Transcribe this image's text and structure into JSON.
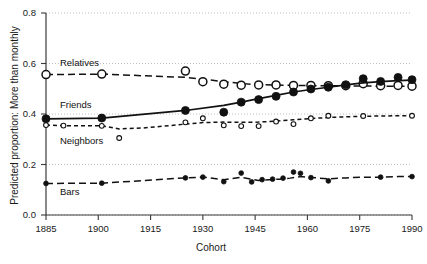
{
  "chart_data": {
    "type": "line",
    "title": "",
    "xlabel": "Cohort",
    "ylabel": "Predicted proportion: More than monthly",
    "xlim": [
      1885,
      1990
    ],
    "ylim": [
      0.0,
      0.8
    ],
    "xticks": [
      1885,
      1900,
      1915,
      1930,
      1945,
      1960,
      1975,
      1990
    ],
    "xticklabels": [
      "1885",
      "1900",
      "1915",
      "1930",
      "1945",
      "1960",
      "1975",
      "1990"
    ],
    "yticks": [
      0.0,
      0.2,
      0.4,
      0.6,
      0.8
    ],
    "yticklabels": [
      "0.0",
      "0.2",
      "0.4",
      "0.6",
      "0.8"
    ],
    "grid": "horizontal-dotted",
    "legend_position": "inline-annotations",
    "series": [
      {
        "name": "Relatives",
        "marker": "open-circle",
        "marker_size": "large",
        "line_style": "dashed",
        "label_x": 1889,
        "label_y": 0.597,
        "fit_x": [
          1885,
          1901,
          1925,
          1930,
          1936,
          1941,
          1945,
          1950,
          1954,
          1958,
          1962,
          1966,
          1971,
          1976,
          1981,
          1985,
          1990
        ],
        "fit_y": [
          0.556,
          0.558,
          0.545,
          0.538,
          0.528,
          0.521,
          0.517,
          0.515,
          0.514,
          0.513,
          0.512,
          0.512,
          0.511,
          0.511,
          0.51,
          0.51,
          0.51
        ],
        "points_x": [
          1885,
          1901,
          1925,
          1930,
          1936,
          1941,
          1946,
          1951,
          1956,
          1961,
          1966,
          1971,
          1976,
          1981,
          1986,
          1990
        ],
        "points_y": [
          0.556,
          0.558,
          0.57,
          0.528,
          0.518,
          0.514,
          0.515,
          0.515,
          0.513,
          0.513,
          0.512,
          0.512,
          0.52,
          0.512,
          0.513,
          0.51
        ]
      },
      {
        "name": "Friends",
        "marker": "filled-circle",
        "marker_size": "large",
        "line_style": "solid",
        "label_x": 1889,
        "label_y": 0.432,
        "fit_x": [
          1885,
          1901,
          1925,
          1936,
          1941,
          1946,
          1951,
          1956,
          1961,
          1966,
          1971,
          1976,
          1981,
          1986,
          1990
        ],
        "fit_y": [
          0.381,
          0.384,
          0.414,
          0.434,
          0.447,
          0.461,
          0.474,
          0.487,
          0.497,
          0.506,
          0.515,
          0.523,
          0.528,
          0.532,
          0.534
        ],
        "points_x": [
          1885,
          1901,
          1925,
          1936,
          1941,
          1946,
          1951,
          1956,
          1961,
          1966,
          1971,
          1976,
          1981,
          1986,
          1990
        ],
        "points_y": [
          0.381,
          0.384,
          0.414,
          0.407,
          0.447,
          0.457,
          0.47,
          0.487,
          0.499,
          0.506,
          0.516,
          0.54,
          0.529,
          0.545,
          0.536
        ]
      },
      {
        "name": "Neighbors",
        "marker": "open-circle",
        "marker_size": "small",
        "line_style": "dotted-dashed",
        "label_x": 1889,
        "label_y": 0.29,
        "fit_x": [
          1885,
          1890,
          1901,
          1906,
          1913,
          1919,
          1925,
          1930,
          1936,
          1941,
          1946,
          1951,
          1956,
          1961,
          1966,
          1971,
          1976,
          1981,
          1986,
          1990
        ],
        "fit_y": [
          0.356,
          0.354,
          0.353,
          0.341,
          0.345,
          0.352,
          0.36,
          0.366,
          0.368,
          0.367,
          0.368,
          0.372,
          0.377,
          0.382,
          0.386,
          0.389,
          0.391,
          0.392,
          0.393,
          0.393
        ],
        "points_x": [
          1885,
          1890,
          1901,
          1906,
          1925,
          1930,
          1936,
          1941,
          1946,
          1951,
          1956,
          1961,
          1966,
          1976,
          1990
        ],
        "points_y": [
          0.356,
          0.354,
          0.353,
          0.305,
          0.367,
          0.383,
          0.355,
          0.352,
          0.352,
          0.37,
          0.36,
          0.383,
          0.393,
          0.392,
          0.393
        ]
      },
      {
        "name": "Bars",
        "marker": "filled-circle",
        "marker_size": "small",
        "line_style": "dashed",
        "label_x": 1889,
        "label_y": 0.086,
        "fit_x": [
          1885,
          1901,
          1925,
          1930,
          1936,
          1941,
          1946,
          1949,
          1952,
          1955,
          1958,
          1961,
          1966,
          1971,
          1976,
          1981,
          1986,
          1990
        ],
        "fit_y": [
          0.125,
          0.126,
          0.147,
          0.15,
          0.14,
          0.149,
          0.137,
          0.14,
          0.142,
          0.146,
          0.152,
          0.149,
          0.143,
          0.147,
          0.15,
          0.15,
          0.152,
          0.152
        ],
        "points_x": [
          1885,
          1901,
          1925,
          1930,
          1936,
          1941,
          1944,
          1947,
          1950,
          1953,
          1956,
          1958,
          1961,
          1966,
          1981,
          1990
        ],
        "points_y": [
          0.125,
          0.126,
          0.147,
          0.15,
          0.132,
          0.166,
          0.131,
          0.14,
          0.142,
          0.146,
          0.17,
          0.165,
          0.148,
          0.135,
          0.15,
          0.152
        ]
      }
    ]
  },
  "axis": {
    "x_title": "Cohort",
    "y_title": "Predicted proportion: More than monthly"
  }
}
